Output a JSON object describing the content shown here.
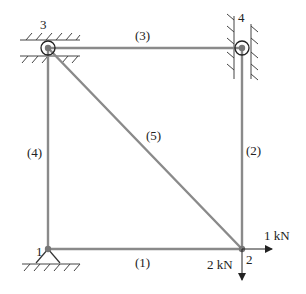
{
  "diagram": {
    "type": "plane-truss",
    "colors": {
      "member": "#8a8a8a",
      "ink": "#222222",
      "background": "#ffffff"
    },
    "nodes": [
      {
        "id": "1",
        "label": "1",
        "x": 48,
        "y": 249,
        "support": "pin-ground"
      },
      {
        "id": "2",
        "label": "2",
        "x": 242,
        "y": 249,
        "support": "free"
      },
      {
        "id": "3",
        "label": "3",
        "x": 48,
        "y": 48,
        "support": "horizontal-roller-guide"
      },
      {
        "id": "4",
        "label": "4",
        "x": 242,
        "y": 48,
        "support": "vertical-roller-guide"
      }
    ],
    "members": [
      {
        "id": "1",
        "label": "(1)",
        "from": "1",
        "to": "2"
      },
      {
        "id": "2",
        "label": "(2)",
        "from": "2",
        "to": "4"
      },
      {
        "id": "3",
        "label": "(3)",
        "from": "3",
        "to": "4"
      },
      {
        "id": "4",
        "label": "(4)",
        "from": "1",
        "to": "3"
      },
      {
        "id": "5",
        "label": "(5)",
        "from": "3",
        "to": "2"
      }
    ],
    "loads": [
      {
        "node": "2",
        "label": "1 kN",
        "direction": "right"
      },
      {
        "node": "2",
        "label": "2 kN",
        "direction": "down"
      }
    ]
  }
}
